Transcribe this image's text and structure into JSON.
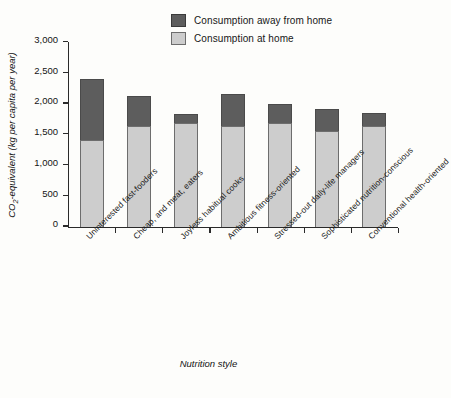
{
  "chart_data": {
    "type": "bar",
    "subtype": "stacked-vertical",
    "title": "",
    "xlabel": "Nutrition style",
    "ylabel": "CO2-equivalent (kg per capita per year)",
    "ylabel_prefix": "CO",
    "ylabel_sub": "2",
    "ylabel_suffix": "-equivalent (kg per capita per year)",
    "ylim": [
      0,
      3000
    ],
    "ytick_values": [
      0,
      500,
      1000,
      1500,
      2000,
      2500,
      3000
    ],
    "ytick_labels": [
      "0",
      "500",
      "1,000",
      "1,500",
      "2,000",
      "2,500",
      "3,000"
    ],
    "grid": false,
    "legend_position": "top-center",
    "categories": [
      "Uninterested fast-fooders",
      "Cheap, and meat, eaters",
      "Joyless habitual cooks",
      "Ambitious fitness-oriented",
      "Stressed-out daily-life managers",
      "Sophisticated nutrition-conscious",
      "Conventional health-oriented"
    ],
    "series": [
      {
        "name": "Consumption at home",
        "color": "#cdcdcd",
        "values": [
          1400,
          1640,
          1680,
          1640,
          1690,
          1560,
          1630
        ]
      },
      {
        "name": "Consumption away from home",
        "color": "#5d5d5d",
        "values": [
          1000,
          480,
          150,
          520,
          310,
          350,
          210
        ]
      }
    ],
    "totals": [
      2400,
      2120,
      1830,
      2160,
      2000,
      1910,
      1840
    ]
  },
  "legend": {
    "items": [
      {
        "label": "Consumption away from home",
        "color": "#5d5d5d"
      },
      {
        "label": "Consumption at home",
        "color": "#cdcdcd"
      }
    ]
  }
}
